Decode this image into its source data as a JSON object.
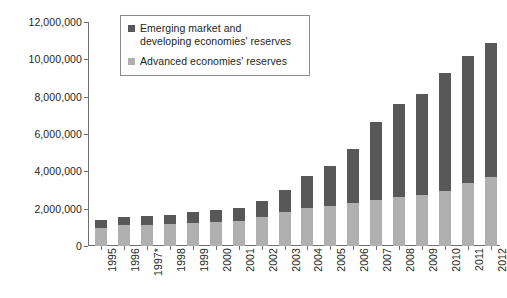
{
  "chart_data": {
    "type": "bar",
    "subtype": "stacked-bar",
    "title": "",
    "xlabel": "",
    "ylabel": "Reserves (US$m)",
    "ylim": [
      0,
      12000000
    ],
    "ytick_values": [
      0,
      2000000,
      4000000,
      6000000,
      8000000,
      10000000,
      12000000
    ],
    "ytick_labels": [
      "0",
      "2,000,000",
      "4,000,000",
      "6,000,000",
      "8,000,000",
      "10,000,000",
      "12,000,000"
    ],
    "grid": false,
    "legend_position": "top-left-inside",
    "categories": [
      "1995",
      "1996",
      "1997*",
      "1998",
      "1999",
      "2000",
      "2001",
      "2002",
      "2003",
      "2004",
      "2005",
      "2006",
      "2007",
      "2008",
      "2009",
      "2010",
      "2011",
      "2012"
    ],
    "series": [
      {
        "name": "Advanced economies' reserves",
        "color": "#b0b0b0",
        "values": [
          950000,
          1100000,
          1150000,
          1200000,
          1250000,
          1300000,
          1350000,
          1550000,
          1800000,
          2050000,
          2150000,
          2300000,
          2450000,
          2650000,
          2750000,
          2950000,
          3400000,
          3700000
        ]
      },
      {
        "name": "Emerging market and developing economies' reserves",
        "color": "#585858",
        "values": [
          450000,
          450000,
          450000,
          450000,
          550000,
          650000,
          700000,
          850000,
          1200000,
          1700000,
          2150000,
          2900000,
          4200000,
          4950000,
          5400000,
          6300000,
          6800000,
          7200000
        ]
      }
    ],
    "totals": [
      1400000,
      1550000,
      1600000,
      1650000,
      1800000,
      1950000,
      2050000,
      2400000,
      3000000,
      3750000,
      4300000,
      5200000,
      6650000,
      7600000,
      8150000,
      9250000,
      10200000,
      10900000
    ]
  },
  "legend": {
    "items": [
      {
        "line1": "Emerging market and",
        "line2": "developing economies' reserves",
        "color": "#585858"
      },
      {
        "line1": "Advanced economies' reserves",
        "line2": "",
        "color": "#b0b0b0"
      }
    ]
  },
  "axes": {
    "y_title": "Reserves (US$m)"
  },
  "colors": {
    "emerging": "#585858",
    "advanced": "#b0b0b0",
    "axis": "#6f6f6f",
    "text": "#231f20",
    "background": "#ffffff",
    "legend_border": "#8a8a8a"
  }
}
